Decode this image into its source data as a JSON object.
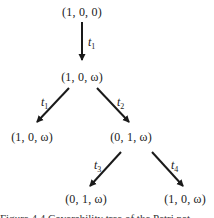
{
  "diagram": {
    "type": "coverability-tree",
    "nodes": [
      {
        "id": "root",
        "label": "(1, 0, 0)"
      },
      {
        "id": "n1",
        "label": "(1, 0, ω)"
      },
      {
        "id": "n2",
        "label": "(1, 0, ω)"
      },
      {
        "id": "n3",
        "label": "(0, 1, ω)"
      },
      {
        "id": "n4",
        "label": "(0, 1, ω)"
      },
      {
        "id": "n5",
        "label": "(1, 0, ω)"
      }
    ],
    "edges": [
      {
        "from": "root",
        "to": "n1",
        "label": "t",
        "sub": "1"
      },
      {
        "from": "n1",
        "to": "n2",
        "label": "t",
        "sub": "1"
      },
      {
        "from": "n1",
        "to": "n3",
        "label": "t",
        "sub": "2"
      },
      {
        "from": "n3",
        "to": "n4",
        "label": "t",
        "sub": "3"
      },
      {
        "from": "n3",
        "to": "n5",
        "label": "t",
        "sub": "4"
      }
    ],
    "line_color": "#1a1a1a"
  },
  "caption": {
    "text": "Figure 4.4  Coverability tree of the Petri net"
  }
}
